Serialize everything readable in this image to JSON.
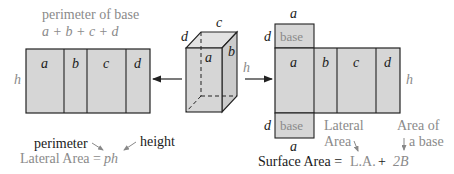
{
  "colors": {
    "face_fill": "#d6d6d6",
    "stroke": "#222222",
    "gray_text": "#8a8a8a",
    "dark_text": "#1a1a1a"
  },
  "left_net": {
    "title": "perimeter of base",
    "formula": "a + b + c + d",
    "height_label": "h",
    "faces": [
      "a",
      "b",
      "c",
      "d"
    ]
  },
  "prism": {
    "top_label": "c",
    "depth_label": "d",
    "front_label": "a",
    "side_label": "b",
    "arrow_right_label": "h"
  },
  "right_net": {
    "top_base": {
      "width_label": "a",
      "depth_label": "d",
      "text": "base"
    },
    "faces": [
      "a",
      "b",
      "c",
      "d"
    ],
    "height_label": "h",
    "bottom_base": {
      "width_label": "a",
      "depth_label": "d",
      "text": "base"
    }
  },
  "lateral_formula": {
    "perimeter_label": "perimeter",
    "height_label": "height",
    "lhs": "Lateral Area =",
    "rhs": "ph"
  },
  "surface_formula": {
    "lateral_note_line1": "Lateral",
    "lateral_note_line2": "Area",
    "base_note_line1": "Area of",
    "base_note_line2": "a base",
    "lhs": "Surface Area =",
    "la": "L.A.",
    "plus": "+",
    "twoB": "2B"
  }
}
